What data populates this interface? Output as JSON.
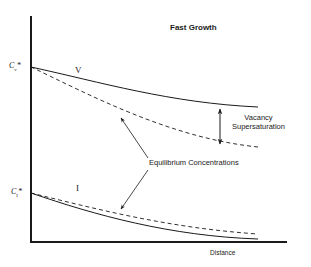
{
  "diagram": {
    "title": "Fast Growth",
    "axes": {
      "y_ticks": [
        {
          "main": "C",
          "sub": "v",
          "sup": "*"
        },
        {
          "main": "C",
          "sub": "I",
          "sup": "*"
        }
      ],
      "x_label": "Distance"
    },
    "curves": {
      "vacancy_label": "V",
      "interstitial_label": "I"
    },
    "annotations": {
      "supersaturation_line1": "Vacancy",
      "supersaturation_line2": "Supersaturation",
      "equilibrium": "Equilibrium Concentrations"
    },
    "colors": {
      "line": "#1a1a1a",
      "background": "#ffffff"
    }
  }
}
